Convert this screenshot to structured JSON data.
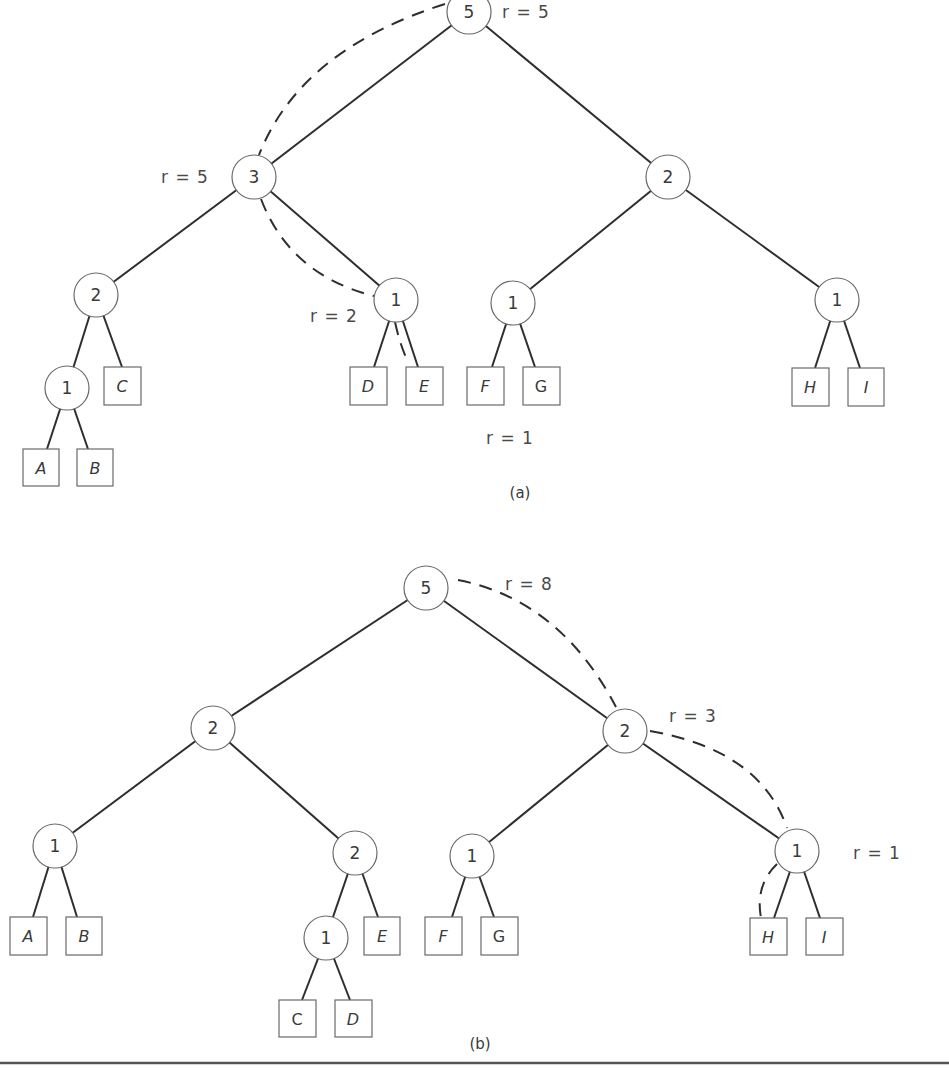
{
  "figure_a": {
    "caption": "(a)",
    "nodes": {
      "root": "5",
      "l": "3",
      "ll": "2",
      "lll": "1",
      "lr": "1",
      "r": "2",
      "rl": "1",
      "rr": "1"
    },
    "leaves": [
      "A",
      "B",
      "C",
      "D",
      "E",
      "F",
      "G",
      "H",
      "I"
    ],
    "rank_labels": {
      "root": "r = 5",
      "l": "r = 5",
      "lr": "r = 2",
      "below": "r = 1"
    }
  },
  "figure_b": {
    "caption": "(b)",
    "nodes": {
      "root": "5",
      "l": "2",
      "ll": "1",
      "lr": "2",
      "lrl": "1",
      "r": "2",
      "rl": "1",
      "rr": "1"
    },
    "leaves": [
      "A",
      "B",
      "C",
      "D",
      "E",
      "F",
      "G",
      "H",
      "I"
    ],
    "rank_labels": {
      "root": "r = 8",
      "r": "r = 3",
      "rr": "r = 1"
    }
  }
}
